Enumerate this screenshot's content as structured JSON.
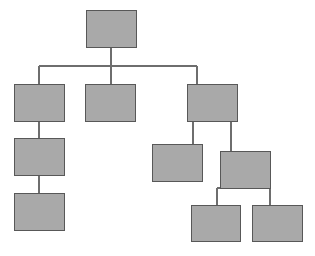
{
  "diagram": {
    "type": "tree-hierarchy-diagram",
    "title": "",
    "canvas": {
      "width": 315,
      "height": 256,
      "background": "#ffffff"
    },
    "style": {
      "node_fill": "#a9a9a9",
      "node_stroke": "#585858",
      "node_stroke_width": 1.5,
      "connector_color": "#6e6e6e",
      "connector_width": 1.5
    },
    "nodes": [
      {
        "id": "n1",
        "label": "",
        "x": 86,
        "y": 10,
        "width": 50,
        "height": 37,
        "level": 0
      },
      {
        "id": "n2",
        "label": "",
        "x": 14,
        "y": 84,
        "width": 50,
        "height": 37,
        "level": 1
      },
      {
        "id": "n3",
        "label": "",
        "x": 85,
        "y": 84,
        "width": 50,
        "height": 37,
        "level": 1
      },
      {
        "id": "n4",
        "label": "",
        "x": 187,
        "y": 84,
        "width": 50,
        "height": 37,
        "level": 1
      },
      {
        "id": "n5",
        "label": "",
        "x": 14,
        "y": 138,
        "width": 50,
        "height": 37,
        "level": 2
      },
      {
        "id": "n6",
        "label": "",
        "x": 152,
        "y": 144,
        "width": 50,
        "height": 37,
        "level": 2
      },
      {
        "id": "n7",
        "label": "",
        "x": 220,
        "y": 151,
        "width": 50,
        "height": 37,
        "level": 2
      },
      {
        "id": "n8",
        "label": "",
        "x": 14,
        "y": 193,
        "width": 50,
        "height": 37,
        "level": 3
      },
      {
        "id": "n9",
        "label": "",
        "x": 191,
        "y": 205,
        "width": 49,
        "height": 36,
        "level": 3
      },
      {
        "id": "n10",
        "label": "",
        "x": 252,
        "y": 205,
        "width": 50,
        "height": 36,
        "level": 3
      }
    ],
    "edges": [
      {
        "from": "n1",
        "to": "n2",
        "kind": "orthogonal-bus"
      },
      {
        "from": "n1",
        "to": "n3",
        "kind": "orthogonal-bus"
      },
      {
        "from": "n1",
        "to": "n4",
        "kind": "orthogonal-bus"
      },
      {
        "from": "n2",
        "to": "n5",
        "kind": "vertical"
      },
      {
        "from": "n5",
        "to": "n8",
        "kind": "vertical"
      },
      {
        "from": "n4",
        "to": "n6",
        "kind": "vertical"
      },
      {
        "from": "n4",
        "to": "n7",
        "kind": "vertical"
      },
      {
        "from": "n7",
        "to": "n9",
        "kind": "orthogonal-bus"
      },
      {
        "from": "n7",
        "to": "n10",
        "kind": "orthogonal-bus"
      }
    ],
    "connector_paths": [
      {
        "id": "root-drop",
        "d": "M 111 47 L 111 66"
      },
      {
        "id": "level1-bus",
        "d": "M 39 66 L 197 66"
      },
      {
        "id": "drop-to-n2",
        "d": "M 39 66 L 39 84"
      },
      {
        "id": "drop-to-n3",
        "d": "M 111 66 L 111 84"
      },
      {
        "id": "drop-to-n4",
        "d": "M 197 66 L 197 84"
      },
      {
        "id": "n2-to-n5",
        "d": "M 39 121 L 39 138"
      },
      {
        "id": "n5-to-n8",
        "d": "M 39 175 L 39 193"
      },
      {
        "id": "n4-to-n6",
        "d": "M 193 121 L 193 144"
      },
      {
        "id": "n4-to-n7",
        "d": "M 231 121 L 231 151"
      },
      {
        "id": "n7-bus",
        "d": "M 217 188 L 270 188"
      },
      {
        "id": "drop-to-n9",
        "d": "M 217 188 L 217 205"
      },
      {
        "id": "drop-to-n10",
        "d": "M 270 188 L 270 205"
      }
    ]
  }
}
